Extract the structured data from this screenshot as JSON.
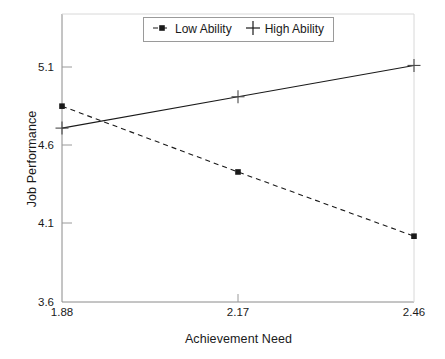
{
  "chart_data": {
    "type": "line",
    "title": "",
    "xlabel": "Achievement Need",
    "ylabel": "Job Performance",
    "x": [
      1.88,
      2.17,
      2.46
    ],
    "xticklabels": [
      "1.88",
      "2.17",
      "2.46"
    ],
    "yticklabels": [
      "5.1",
      "4.6",
      "4.1",
      "3.6"
    ],
    "yticks": [
      5.1,
      4.6,
      4.1,
      3.6
    ],
    "xlim": [
      1.88,
      2.46
    ],
    "ylim": [
      3.6,
      5.36
    ],
    "grid": false,
    "legend_position": "top-center",
    "series": [
      {
        "name": "Low Ability",
        "values": [
          4.85,
          4.43,
          4.02
        ],
        "linestyle": "dashed",
        "marker": "square",
        "color": "#1a1a1a"
      },
      {
        "name": "High Ability",
        "values": [
          4.71,
          4.91,
          5.11
        ],
        "linestyle": "solid",
        "marker": "plus",
        "color": "#1a1a1a"
      }
    ]
  },
  "legend": {
    "items": [
      {
        "label": "Low Ability",
        "marker": "dashed-square-marker"
      },
      {
        "label": "High Ability",
        "marker": "plus-marker"
      }
    ]
  },
  "axes": {
    "y_label": "Job Performance",
    "x_label": "Achievement Need",
    "y_ticks": [
      "5.1",
      "4.6",
      "4.1",
      "3.6"
    ],
    "x_ticks": [
      "1.88",
      "2.17",
      "2.46"
    ]
  },
  "colors": {
    "line": "#1a1a1a",
    "frame": "#8a8a8a",
    "background": "#ffffff"
  }
}
